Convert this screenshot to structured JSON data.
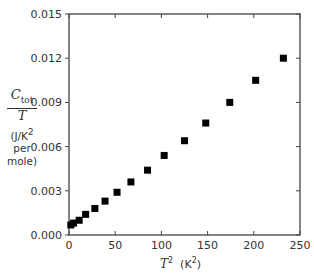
{
  "chart_data": {
    "type": "scatter",
    "title": "",
    "xlabel": "T^2 (K^2)",
    "ylabel": "C_tot / T (J/K^2 per mole)",
    "xlim": [
      0,
      250
    ],
    "ylim": [
      0,
      0.015
    ],
    "xticks": [
      0,
      50,
      100,
      150,
      200,
      250
    ],
    "xtick_labels": [
      "0",
      "50",
      "100",
      "150",
      "200",
      "250"
    ],
    "yticks": [
      0,
      0.003,
      0.006,
      0.009,
      0.012,
      0.015
    ],
    "ytick_labels": [
      "0.000",
      "0.003",
      "0.006",
      "0.009",
      "0.012",
      "0.015"
    ],
    "grid": false,
    "legend": null,
    "marker": "filled-square",
    "marker_color": "#000000",
    "series": [
      {
        "name": "C_tot/T",
        "x": [
          2,
          5,
          11,
          18,
          28,
          39,
          52,
          67,
          85,
          103,
          125,
          148,
          174,
          202,
          232
        ],
        "y": [
          0.00068,
          0.00081,
          0.001,
          0.0014,
          0.0018,
          0.0023,
          0.0029,
          0.0036,
          0.0044,
          0.0054,
          0.0064,
          0.0076,
          0.009,
          0.0105,
          0.012
        ]
      }
    ]
  },
  "labels": {
    "y_num_main": "C",
    "y_num_sub": "tot",
    "y_den": "T",
    "y_unit_line1": "(J/K",
    "y_unit_sup": "2",
    "y_unit_line2": "per",
    "y_unit_line3": "mole)",
    "x_var": "T",
    "x_var_sup": "2",
    "x_unit_open": "(K",
    "x_unit_sup": "2",
    "x_unit_close": ")"
  },
  "colors": {
    "axis": "#444444",
    "text": "#333333",
    "marker": "#000000"
  }
}
